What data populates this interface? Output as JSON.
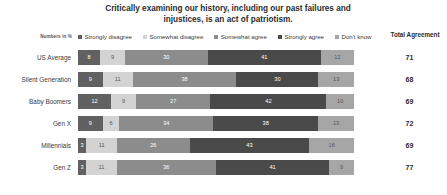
{
  "title": {
    "line1": "Critically examining our history, including our past failures and",
    "line2": "injustices, is an act of patriotism."
  },
  "units_note": "Numbers in %",
  "total_header": "Total Agreement",
  "colors": {
    "strongly_disagree": "#616161",
    "somewhat_disagree": "#d3d3d3",
    "somewhat_agree": "#8c8c8c",
    "strongly_agree": "#4a4a4a",
    "dont_know": "#a6a6a6",
    "text": "#3a3a3a",
    "background": "#ffffff"
  },
  "chart_data": {
    "type": "bar",
    "title": "Critically examining our history, including our past failures and injustices, is an act of patriotism.",
    "xlabel": "",
    "ylabel": "",
    "xlim": [
      0,
      100
    ],
    "grid": false,
    "legend_position": "top",
    "stacked": true,
    "orientation": "horizontal",
    "units": "percent",
    "categories": [
      "US Average",
      "Silent Generation",
      "Baby Boomers",
      "Gen X",
      "Millennials",
      "Gen Z"
    ],
    "series": [
      {
        "name": "Strongly disagree",
        "color": "#616161",
        "values": [
          8,
          9,
          12,
          9,
          3,
          3
        ]
      },
      {
        "name": "Somewhat disagree",
        "color": "#d3d3d3",
        "values": [
          9,
          11,
          9,
          6,
          11,
          11
        ]
      },
      {
        "name": "Somewhat agree",
        "color": "#8c8c8c",
        "values": [
          30,
          38,
          27,
          34,
          26,
          36
        ]
      },
      {
        "name": "Strongly agree",
        "color": "#4a4a4a",
        "values": [
          41,
          30,
          42,
          38,
          43,
          41
        ]
      },
      {
        "name": "Don't know",
        "color": "#a6a6a6",
        "values": [
          12,
          13,
          10,
          13,
          16,
          9
        ]
      }
    ],
    "total_agreement": [
      71,
      68,
      69,
      72,
      69,
      77
    ],
    "annotations": [
      "Numbers in %",
      "Total Agreement"
    ]
  },
  "rows": [
    {
      "label": "US Average",
      "segments": [
        8,
        9,
        30,
        41,
        12
      ],
      "total": 71
    },
    {
      "label": "Silent Generation",
      "segments": [
        9,
        11,
        38,
        30,
        13
      ],
      "total": 68
    },
    {
      "label": "Baby Boomers",
      "segments": [
        12,
        9,
        27,
        42,
        10
      ],
      "total": 69
    },
    {
      "label": "Gen X",
      "segments": [
        9,
        6,
        34,
        38,
        13
      ],
      "total": 72
    },
    {
      "label": "Millennials",
      "segments": [
        3,
        11,
        26,
        43,
        16
      ],
      "total": 69
    },
    {
      "label": "Gen Z",
      "segments": [
        3,
        11,
        36,
        41,
        9
      ],
      "total": 77
    }
  ]
}
